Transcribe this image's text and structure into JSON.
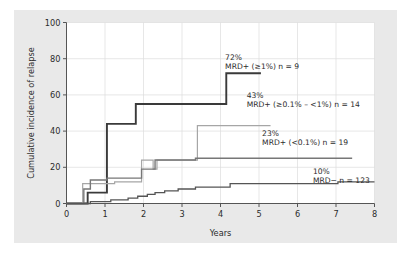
{
  "chart_data": {
    "type": "line",
    "title": "",
    "xlabel": "Years",
    "ylabel": "Cumulative incidence of relapse",
    "xlim": [
      0,
      8
    ],
    "ylim": [
      0,
      100
    ],
    "xticks": [
      "0",
      "1",
      "2",
      "3",
      "4",
      "5",
      "6",
      "7",
      "8"
    ],
    "yticks": [
      "0",
      "20",
      "40",
      "60",
      "80",
      "100"
    ],
    "grid": true,
    "legend_position": "inline-annotations",
    "step_style": "post",
    "series": [
      {
        "name": "MRD+ (≥1%) n = 9",
        "group": "MRD+ (≥1%)",
        "n": 9,
        "final_value_pct": "72%",
        "final_value": 72,
        "color": "#3a3a3a",
        "width": 1.9,
        "annotation_pct": "72%",
        "annotation_label": "MRD+ (≥1%) n = 9",
        "points": [
          [
            0.0,
            0
          ],
          [
            0.55,
            0
          ],
          [
            0.55,
            6
          ],
          [
            1.05,
            6
          ],
          [
            1.05,
            44
          ],
          [
            1.8,
            44
          ],
          [
            1.8,
            55
          ],
          [
            4.15,
            55
          ],
          [
            4.15,
            72
          ],
          [
            5.05,
            72
          ]
        ]
      },
      {
        "name": "MRD+ (≥0.1% – <1%) n = 14",
        "group": "MRD+ (≥0.1% – <1%)",
        "n": 14,
        "final_value_pct": "43%",
        "final_value": 43,
        "color": "#a6a6a6",
        "width": 1.2,
        "annotation_pct": "43%",
        "annotation_label": "MRD+ (≥0.1% – <1%) n = 14",
        "points": [
          [
            0.0,
            0
          ],
          [
            0.42,
            0
          ],
          [
            0.42,
            11
          ],
          [
            1.25,
            11
          ],
          [
            1.25,
            12
          ],
          [
            1.95,
            12
          ],
          [
            1.95,
            24
          ],
          [
            2.25,
            24
          ],
          [
            2.25,
            19
          ],
          [
            2.35,
            19
          ],
          [
            2.35,
            24
          ],
          [
            3.4,
            24
          ],
          [
            3.4,
            43
          ],
          [
            5.3,
            43
          ]
        ]
      },
      {
        "name": "MRD+ (<0.1%) n = 19",
        "group": "MRD+ (<0.1%)",
        "n": 19,
        "final_value_pct": "23%",
        "final_value": 23,
        "color": "#777777",
        "width": 1.4,
        "annotation_pct": "23%",
        "annotation_label": "MRD+ (<0.1%) n = 19",
        "points": [
          [
            0.0,
            0
          ],
          [
            0.45,
            0
          ],
          [
            0.45,
            8
          ],
          [
            0.62,
            8
          ],
          [
            0.62,
            13
          ],
          [
            1.05,
            13
          ],
          [
            1.05,
            14
          ],
          [
            1.95,
            14
          ],
          [
            1.95,
            19
          ],
          [
            2.3,
            19
          ],
          [
            2.3,
            24
          ],
          [
            3.35,
            24
          ],
          [
            3.35,
            25
          ],
          [
            7.42,
            25
          ]
        ]
      },
      {
        "name": "MRD−  n = 123",
        "group": "MRD−",
        "n": 123,
        "final_value_pct": "10%",
        "final_value": 10,
        "color": "#555555",
        "width": 1.3,
        "annotation_pct": "10%",
        "annotation_label": "MRD−  n = 123",
        "points": [
          [
            0.0,
            0
          ],
          [
            0.62,
            0
          ],
          [
            0.62,
            1
          ],
          [
            1.15,
            1
          ],
          [
            1.15,
            2
          ],
          [
            1.6,
            2
          ],
          [
            1.6,
            3
          ],
          [
            1.85,
            3
          ],
          [
            1.85,
            4
          ],
          [
            2.1,
            4
          ],
          [
            2.1,
            5
          ],
          [
            2.3,
            5
          ],
          [
            2.3,
            6
          ],
          [
            2.55,
            6
          ],
          [
            2.55,
            7
          ],
          [
            2.9,
            7
          ],
          [
            2.9,
            8
          ],
          [
            3.35,
            8
          ],
          [
            3.35,
            9
          ],
          [
            4.25,
            9
          ],
          [
            4.25,
            11
          ],
          [
            7.05,
            11
          ],
          [
            7.05,
            12
          ],
          [
            8.0,
            12
          ]
        ]
      }
    ],
    "annotations": [
      {
        "pct": "72%",
        "label": "MRD+ (≥1%) n = 9",
        "x_pct": 0.515,
        "y_pct": 0.795
      },
      {
        "pct": "43%",
        "label": "MRD+ (≥0.1% – <1%) n = 14",
        "x_pct": 0.585,
        "y_pct": 0.585
      },
      {
        "pct": "23%",
        "label": "MRD+ (<0.1%) n = 19",
        "x_pct": 0.635,
        "y_pct": 0.375
      },
      {
        "pct": "10%",
        "label": "MRD−  n = 123",
        "x_pct": 0.8,
        "y_pct": 0.165
      }
    ]
  },
  "figure": {
    "panel_color": "#e9e9e9",
    "plot_bg_color": "#ffffff",
    "grid_color": "#dcdcdc",
    "axis_color": "#555555"
  }
}
